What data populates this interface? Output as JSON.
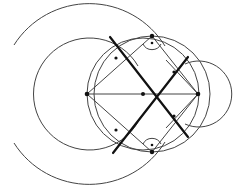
{
  "diagram": {
    "type": "geometric-construction",
    "colors": {
      "background": "#ffffff",
      "thin_line": "#444444",
      "thick_line": "#111111",
      "point": "#111111"
    },
    "points": [
      {
        "id": "A",
        "x": 87,
        "y": 94
      },
      {
        "id": "M",
        "x": 143,
        "y": 94
      },
      {
        "id": "B",
        "x": 198,
        "y": 94
      },
      {
        "id": "P",
        "x": 152,
        "y": 36
      },
      {
        "id": "Q",
        "x": 152,
        "y": 152
      },
      {
        "id": "R1",
        "x": 116,
        "y": 58
      },
      {
        "id": "R2",
        "x": 174,
        "y": 116
      },
      {
        "id": "R3",
        "x": 174,
        "y": 72
      },
      {
        "id": "R4",
        "x": 116,
        "y": 130
      }
    ],
    "circles": [
      {
        "id": "outer-arc",
        "cx": 90,
        "cy": 94,
        "r": 89,
        "arc": true
      },
      {
        "id": "middle-arc",
        "cx": 90,
        "cy": 94,
        "r": 56,
        "arc": true
      },
      {
        "id": "circle-AB",
        "cx": 143,
        "cy": 94,
        "r": 57
      },
      {
        "id": "circle-PQ",
        "cx": 152,
        "cy": 94,
        "r": 58
      },
      {
        "id": "circle-B",
        "cx": 198,
        "cy": 94,
        "r": 33
      }
    ],
    "right_angle_markers": [
      {
        "at": "P",
        "label_dot": true
      },
      {
        "at": "Q",
        "label_dot": true
      }
    ]
  }
}
